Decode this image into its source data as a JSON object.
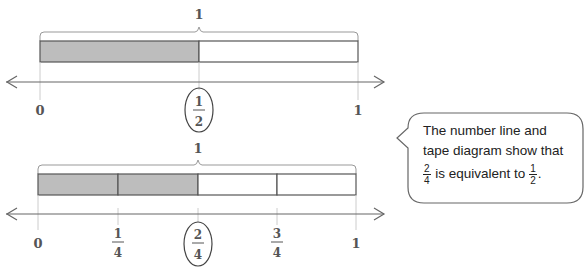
{
  "diagram_top": {
    "whole_label": "1",
    "parts": 2,
    "shaded_parts": 1,
    "tick_labels": [
      {
        "num": "0",
        "den": ""
      },
      {
        "num": "1",
        "den": "2",
        "circled": true
      },
      {
        "num": "1",
        "den": ""
      }
    ]
  },
  "diagram_bottom": {
    "whole_label": "1",
    "parts": 4,
    "shaded_parts": 2,
    "tick_labels": [
      {
        "num": "0",
        "den": ""
      },
      {
        "num": "1",
        "den": "4"
      },
      {
        "num": "2",
        "den": "4",
        "circled": true
      },
      {
        "num": "3",
        "den": "4"
      },
      {
        "num": "1",
        "den": ""
      }
    ]
  },
  "callout": {
    "line1": "The number line and",
    "line2": "tape diagram show that",
    "frac_a_num": "2",
    "frac_a_den": "4",
    "middle_text": " is equivalent to ",
    "frac_b_num": "1",
    "frac_b_den": "2",
    "end_punct": "."
  },
  "colors": {
    "shaded": "#bdbdbd",
    "outline": "#555555",
    "line": "#666666"
  }
}
